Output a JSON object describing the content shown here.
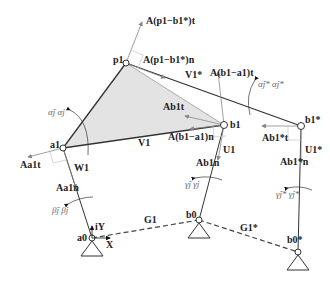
{
  "diagram": {
    "type": "planar mechanism / four-bar linkage kinematics",
    "points": [
      {
        "id": "a0",
        "label": "a",
        "sub": "0",
        "x": 92,
        "y": 238
      },
      {
        "id": "a1",
        "label": "a",
        "sub": "1",
        "x": 63,
        "y": 148
      },
      {
        "id": "p1",
        "label": "p",
        "sub": "1",
        "x": 126,
        "y": 63
      },
      {
        "id": "b1",
        "label": "b",
        "sub": "1",
        "x": 224,
        "y": 125
      },
      {
        "id": "b1s",
        "label": "b",
        "sub": "1",
        "sup": "*",
        "x": 301,
        "y": 126
      },
      {
        "id": "b0",
        "label": "b",
        "sub": "0",
        "x": 199,
        "y": 220
      },
      {
        "id": "b0s",
        "label": "b",
        "sub": "0",
        "sup": "*",
        "x": 298,
        "y": 252
      }
    ],
    "labels": {
      "A_p1b1s_t": "A(p1−b1*)t",
      "A_p1b1s_n": "A(p1−b1*)n",
      "V1s": "V1*",
      "A_b1a1_t": "A(b1−a1)t",
      "alpha_s": "α̈j* α̇j*",
      "A_b1t": "Ab1t",
      "b1": "b1",
      "b1s": "b1*",
      "A_b1s_t": "Ab1*t",
      "alpha": "α̈j α̇j",
      "a1": "a1",
      "V1": "V1",
      "A_b1a1_n": "A(b1−a1)n",
      "A_a1t": "Aa1t",
      "W1": "W1",
      "U1": "U1",
      "U1s": "U1*",
      "A_a1n": "Aa1n",
      "A_b1n": "Ab1n",
      "A_b1s_n": "Ab1*n",
      "gamma": "γ̈j γ̇j",
      "gamma_s": "γ̈j* γ̇j*",
      "beta": "β̈j β̇j",
      "iY": "iY",
      "X": "X",
      "a0": "a0",
      "G1": "G1",
      "b0": "b0",
      "G1s": "G1*",
      "b0s": "b0*",
      "p1": "p1"
    }
  }
}
